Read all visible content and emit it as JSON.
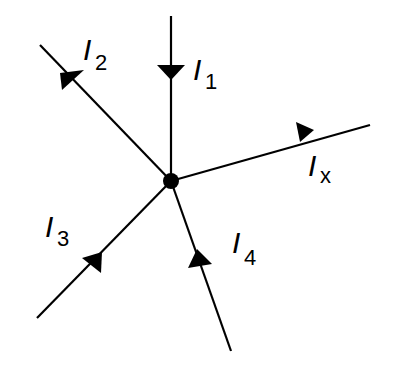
{
  "diagram": {
    "node": {
      "x": 171,
      "y": 181
    },
    "branches": [
      {
        "name": "I1",
        "label_main": "I",
        "label_sub": "1",
        "direction": "into-node"
      },
      {
        "name": "I2",
        "label_main": "I",
        "label_sub": "2",
        "direction": "out-of-node"
      },
      {
        "name": "Ix",
        "label_main": "I",
        "label_sub": "x",
        "direction": "out-of-node"
      },
      {
        "name": "I3",
        "label_main": "I",
        "label_sub": "3",
        "direction": "into-node"
      },
      {
        "name": "I4",
        "label_main": "I",
        "label_sub": "4",
        "direction": "into-node"
      }
    ],
    "colors": {
      "line": "#000000",
      "background": "#ffffff"
    }
  }
}
